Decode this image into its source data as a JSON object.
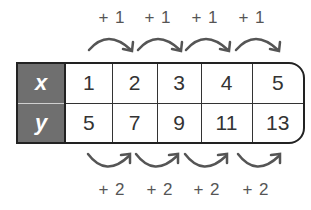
{
  "diagram": {
    "type": "function-table",
    "rows": [
      {
        "header": "x",
        "values": [
          "1",
          "2",
          "3",
          "4",
          "5"
        ]
      },
      {
        "header": "y",
        "values": [
          "5",
          "7",
          "9",
          "11",
          "13"
        ]
      }
    ],
    "top_differences": [
      "+ 1",
      "+ 1",
      "+ 1",
      "+ 1"
    ],
    "bottom_differences": [
      "+ 2",
      "+ 2",
      "+ 2",
      "+ 2"
    ],
    "colors": {
      "header_fill": "#6f6f6f",
      "header_text": "#ffffff",
      "border": "#222222",
      "arrow": "#555555",
      "label_text": "#555555"
    }
  }
}
